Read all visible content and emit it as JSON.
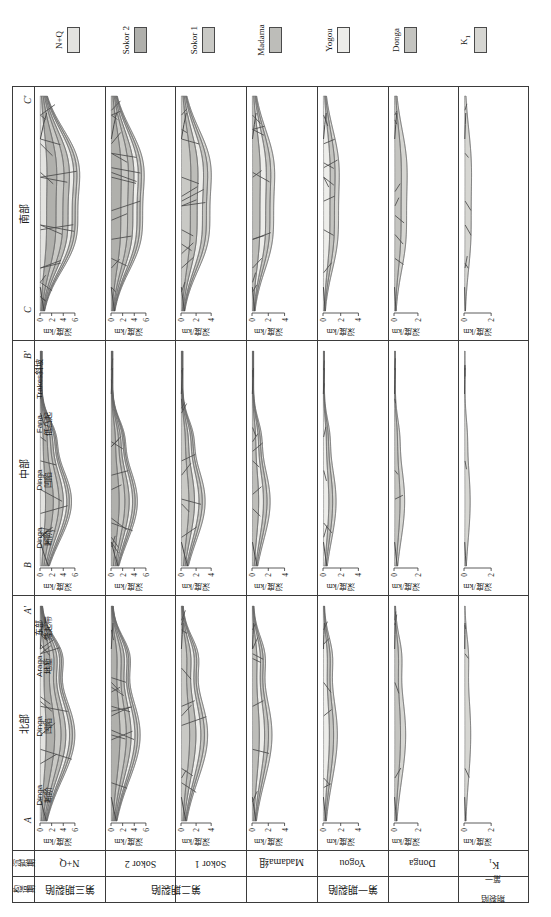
{
  "figure": {
    "axis_label": "深度/km",
    "depth_unit": "km"
  },
  "regions": [
    {
      "key": "north",
      "label": "北部",
      "section_start": "A",
      "section_end": "A'"
    },
    {
      "key": "middle",
      "label": "中部",
      "section_start": "B",
      "section_end": "B'"
    },
    {
      "key": "south",
      "label": "南部",
      "section_start": "C",
      "section_end": "C'"
    }
  ],
  "corner_headers": {
    "sedimentary": "沉积期",
    "tectonic": "构造期"
  },
  "sed_periods": [
    {
      "label": "N+Q",
      "sub": "",
      "ticks": [
        0,
        2,
        4,
        6
      ],
      "ymax": 7.0
    },
    {
      "label": "Sokor 2",
      "sub": "",
      "ticks": [
        0,
        2,
        4,
        6
      ],
      "ymax": 7.0
    },
    {
      "label": "Sokor 1",
      "sub": "",
      "ticks": [
        0,
        2,
        4
      ],
      "ymax": 5.4
    },
    {
      "label": "Madama组",
      "sub": "",
      "ticks": [
        0,
        2,
        4
      ],
      "ymax": 5.0
    },
    {
      "label": "Yogou",
      "sub": "",
      "ticks": [
        0,
        2,
        4
      ],
      "ymax": 4.6
    },
    {
      "label": "Donga",
      "sub": "",
      "ticks": [
        0,
        2
      ],
      "ymax": 3.4
    },
    {
      "label": "K",
      "sub": "1",
      "ticks": [
        0,
        2
      ],
      "ymax": 3.0
    }
  ],
  "tect_periods": [
    {
      "label": "第三期裂陷",
      "stacked": false,
      "span": 1
    },
    {
      "label": "第二期裂陷",
      "stacked": false,
      "span": 2
    },
    {
      "label": "第一期裂陷",
      "stacked": false,
      "span": 3
    },
    {
      "label": "第一期\n裂陷",
      "stacked": true,
      "line1": "第一",
      "line2": "期裂陷",
      "span": 1
    }
  ],
  "structural_labels": {
    "north": [
      {
        "en": "Dinga",
        "cn": "断阶",
        "x": 0.12
      },
      {
        "en": "Dinga",
        "cn": "凹陷",
        "x": 0.44
      },
      {
        "en": "Araga",
        "cn": "地堑",
        "x": 0.72
      },
      {
        "en": "东部",
        "cn": "隆起带",
        "x": 0.9
      }
    ],
    "middle": [
      {
        "en": "Dinga",
        "cn": "断阶",
        "x": 0.13
      },
      {
        "en": "Dinga",
        "cn": "凹陷",
        "x": 0.4
      },
      {
        "en": "Fana",
        "cn": "低凸起",
        "x": 0.66
      },
      {
        "en": "Trakes斜坡",
        "cn": "",
        "x": 0.87
      }
    ],
    "south": []
  },
  "legend": {
    "items": [
      {
        "name": "N+Q",
        "sub": "",
        "color": "#e3e3e0"
      },
      {
        "name": "Sokor 2",
        "sub": "",
        "color": "#b0b0ac"
      },
      {
        "name": "Sokor 1",
        "sub": "",
        "color": "#c9c9c5"
      },
      {
        "name": "Madama",
        "sub": "",
        "color": "#bdbdb9"
      },
      {
        "name": "Yogou",
        "sub": "",
        "color": "#ededea"
      },
      {
        "name": "Donga",
        "sub": "",
        "color": "#c4c4c0"
      },
      {
        "name": "K",
        "sub": "1",
        "color": "#d6d6d2"
      }
    ]
  },
  "colors": {
    "frame": "#3b3b3b",
    "fault": "#4a4a4a",
    "background": "#ffffff",
    "layer_nq": "#e3e3e0",
    "layer_sokor2": "#b0b0ac",
    "layer_sokor1": "#c9c9c5",
    "layer_madama": "#bdbdb9",
    "layer_yogou": "#ededea",
    "layer_donga": "#c4c4c0",
    "layer_k1": "#d6d6d2"
  },
  "chart_data": {
    "type": "area",
    "ylabel": "深度/km",
    "xlabel": "",
    "grid": false,
    "legend_position": "bottom",
    "panels": [
      {
        "region": "北部",
        "period": "N+Q",
        "ylim": [
          0,
          7
        ],
        "layers": [
          {
            "name": "N+Q",
            "top": [
              0.05,
              0.05,
              0.08,
              0.1,
              0.1,
              0.1,
              0.1,
              0.1,
              0.12,
              0.15,
              0.2
            ],
            "base": [
              0.35,
              0.55,
              0.8,
              1.0,
              1.05,
              1.0,
              0.95,
              0.9,
              0.8,
              0.65,
              0.45
            ]
          },
          {
            "name": "Sokor 2",
            "base": [
              0.75,
              1.35,
              1.95,
              2.35,
              2.45,
              2.4,
              2.25,
              2.05,
              1.75,
              1.3,
              0.8
            ]
          },
          {
            "name": "Sokor 1",
            "base": [
              1.1,
              2.0,
              2.9,
              3.45,
              3.6,
              3.5,
              3.3,
              3.0,
              2.55,
              1.85,
              1.1
            ]
          },
          {
            "name": "Madama",
            "base": [
              1.35,
              2.45,
              3.55,
              4.25,
              4.45,
              4.35,
              4.1,
              3.7,
              3.1,
              2.25,
              1.35
            ]
          },
          {
            "name": "Yogou",
            "base": [
              1.55,
              2.8,
              4.05,
              4.85,
              5.1,
              4.95,
              4.65,
              4.2,
              3.5,
              2.55,
              1.5
            ]
          },
          {
            "name": "Donga",
            "base": [
              1.7,
              3.05,
              4.45,
              5.3,
              5.6,
              5.45,
              5.1,
              4.6,
              3.85,
              2.8,
              1.65
            ]
          },
          {
            "name": "K1",
            "base": [
              1.85,
              3.3,
              4.8,
              5.75,
              6.05,
              5.9,
              5.55,
              5.0,
              4.15,
              3.0,
              1.8
            ]
          }
        ]
      },
      {
        "region": "北部",
        "period": "Sokor 2",
        "ylim": [
          0,
          7
        ]
      },
      {
        "region": "北部",
        "period": "Sokor 1",
        "ylim": [
          0,
          5.4
        ]
      },
      {
        "region": "北部",
        "period": "Madama组",
        "ylim": [
          0,
          5
        ]
      },
      {
        "region": "北部",
        "period": "Yogou",
        "ylim": [
          0,
          4.6
        ]
      },
      {
        "region": "北部",
        "period": "Donga",
        "ylim": [
          0,
          3.4
        ]
      },
      {
        "region": "北部",
        "period": "K1",
        "ylim": [
          0,
          3
        ]
      },
      {
        "region": "中部",
        "period": "N+Q",
        "ylim": [
          0,
          7
        ]
      },
      {
        "region": "中部",
        "period": "Sokor 2",
        "ylim": [
          0,
          7
        ]
      },
      {
        "region": "中部",
        "period": "Sokor 1",
        "ylim": [
          0,
          5.4
        ]
      },
      {
        "region": "中部",
        "period": "Madama组",
        "ylim": [
          0,
          5
        ]
      },
      {
        "region": "中部",
        "period": "Yogou",
        "ylim": [
          0,
          4.6
        ]
      },
      {
        "region": "中部",
        "period": "Donga",
        "ylim": [
          0,
          3.4
        ]
      },
      {
        "region": "中部",
        "period": "K1",
        "ylim": [
          0,
          3
        ]
      },
      {
        "region": "南部",
        "period": "N+Q",
        "ylim": [
          0,
          7
        ]
      },
      {
        "region": "南部",
        "period": "Sokor 2",
        "ylim": [
          0,
          7
        ]
      },
      {
        "region": "南部",
        "period": "Sokor 1",
        "ylim": [
          0,
          5.4
        ]
      },
      {
        "region": "南部",
        "period": "Madama组",
        "ylim": [
          0,
          5
        ]
      },
      {
        "region": "南部",
        "period": "Yogou",
        "ylim": [
          0,
          4.6
        ]
      },
      {
        "region": "南部",
        "period": "Donga",
        "ylim": [
          0,
          3.4
        ]
      },
      {
        "region": "南部",
        "period": "K1",
        "ylim": [
          0,
          3
        ]
      }
    ]
  }
}
